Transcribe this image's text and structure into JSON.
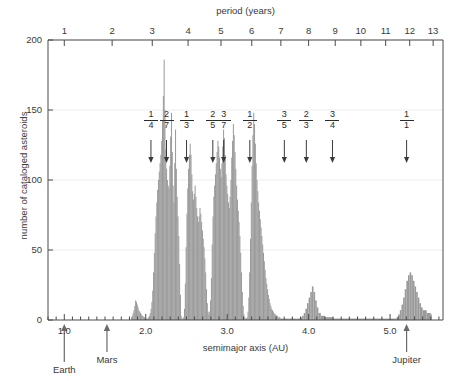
{
  "figure": {
    "top_axis_title": "period (years)",
    "bottom_axis_title": "semimajor axis (AU)",
    "y_axis_title": "number of cataloged asteroids"
  },
  "chart_data": {
    "type": "bar",
    "title": "",
    "xlabel": "semimajor axis (AU)",
    "ylabel": "number of cataloged asteroids",
    "secondary_xlabel": "period (years)",
    "xlim": [
      0.8,
      5.65
    ],
    "ylim": [
      0,
      200
    ],
    "yticks": [
      0,
      50,
      100,
      150,
      200
    ],
    "xticks": [
      1.0,
      2.0,
      3.0,
      4.0,
      5.0
    ],
    "xtick_labels": [
      "1.0",
      "2.0",
      "3.0",
      "4.0",
      "5.0"
    ],
    "xminor_step": 0.1,
    "top_xticks": [
      1,
      2,
      3,
      4,
      5,
      6,
      7,
      8,
      9,
      10,
      11,
      12,
      13,
      14
    ],
    "top_xtick_labels": [
      "1",
      "2",
      "3",
      "4",
      "5",
      "6",
      "7",
      "8",
      "9",
      "10",
      "11",
      "12",
      "13",
      "14"
    ],
    "grid": "horizontal-faint",
    "legend": "none",
    "bar_color": "#9a9a9a",
    "bin_width_au": 0.01,
    "bins_a": [
      1.82,
      1.83,
      1.84,
      1.85,
      1.86,
      1.87,
      1.88,
      1.89,
      1.9,
      1.91,
      1.92,
      1.93,
      1.94,
      1.95,
      1.96,
      1.97,
      1.98,
      1.99,
      2.0,
      2.01,
      2.02,
      2.03,
      2.04,
      2.05,
      2.06,
      2.07,
      2.08,
      2.09,
      2.1,
      2.11,
      2.12,
      2.13,
      2.14,
      2.15,
      2.16,
      2.17,
      2.18,
      2.19,
      2.2,
      2.21,
      2.22,
      2.23,
      2.24,
      2.25,
      2.26,
      2.27,
      2.28,
      2.29,
      2.3,
      2.31,
      2.32,
      2.33,
      2.34,
      2.35,
      2.36,
      2.37,
      2.38,
      2.39,
      2.4,
      2.41,
      2.42,
      2.43,
      2.44,
      2.45,
      2.46,
      2.47,
      2.48,
      2.49,
      2.5,
      2.51,
      2.52,
      2.53,
      2.54,
      2.55,
      2.56,
      2.57,
      2.58,
      2.59,
      2.6,
      2.61,
      2.62,
      2.63,
      2.64,
      2.65,
      2.66,
      2.67,
      2.68,
      2.69,
      2.7,
      2.71,
      2.72,
      2.73,
      2.74,
      2.75,
      2.76,
      2.77,
      2.78,
      2.79,
      2.8,
      2.81,
      2.82,
      2.83,
      2.84,
      2.85,
      2.86,
      2.87,
      2.88,
      2.89,
      2.9,
      2.91,
      2.92,
      2.93,
      2.94,
      2.95,
      2.96,
      2.97,
      2.98,
      2.99,
      3.0,
      3.01,
      3.02,
      3.03,
      3.04,
      3.05,
      3.06,
      3.07,
      3.08,
      3.09,
      3.1,
      3.11,
      3.12,
      3.13,
      3.14,
      3.15,
      3.16,
      3.17,
      3.18,
      3.19,
      3.2,
      3.21,
      3.22,
      3.23,
      3.24,
      3.25,
      3.26,
      3.27,
      3.28,
      3.29,
      3.3,
      3.31,
      3.32,
      3.33,
      3.34,
      3.35,
      3.36,
      3.37,
      3.38,
      3.39,
      3.4,
      3.41,
      3.42,
      3.43,
      3.44,
      3.45,
      3.46,
      3.47,
      3.48,
      3.49,
      3.5,
      3.51,
      3.52,
      3.53,
      3.54,
      3.55,
      3.56,
      3.57,
      3.58,
      3.59,
      3.6,
      3.61,
      3.62,
      3.63,
      3.64,
      3.65,
      3.66,
      3.7,
      3.75,
      3.8,
      3.85,
      3.9,
      3.92,
      3.94,
      3.96,
      3.98,
      4.0,
      4.02,
      4.04,
      4.06,
      4.08,
      4.1,
      4.12,
      4.15,
      4.2,
      4.3,
      4.4,
      4.5,
      4.6,
      4.7,
      4.8,
      4.9,
      5.0,
      5.05,
      5.08,
      5.1,
      5.12,
      5.14,
      5.16,
      5.18,
      5.2,
      5.22,
      5.24,
      5.26,
      5.28,
      5.3,
      5.32,
      5.34,
      5.36,
      5.38,
      5.4,
      5.45,
      5.5
    ],
    "bins_count": [
      2,
      3,
      5,
      7,
      10,
      14,
      13,
      11,
      9,
      7,
      6,
      5,
      4,
      3,
      3,
      2,
      2,
      1,
      1,
      1,
      1,
      2,
      3,
      5,
      8,
      13,
      21,
      34,
      48,
      62,
      74,
      84,
      93,
      100,
      106,
      112,
      118,
      128,
      142,
      160,
      186,
      150,
      122,
      108,
      100,
      96,
      94,
      110,
      131,
      148,
      120,
      96,
      84,
      112,
      136,
      108,
      88,
      74,
      60,
      40,
      18,
      3,
      1,
      1,
      2,
      8,
      26,
      52,
      76,
      94,
      108,
      118,
      126,
      118,
      104,
      92,
      86,
      90,
      96,
      88,
      80,
      74,
      70,
      74,
      80,
      76,
      70,
      64,
      58,
      52,
      44,
      34,
      22,
      12,
      6,
      4,
      6,
      14,
      30,
      54,
      74,
      88,
      96,
      104,
      112,
      120,
      128,
      124,
      116,
      108,
      102,
      112,
      124,
      136,
      130,
      118,
      104,
      96,
      90,
      84,
      80,
      88,
      100,
      116,
      128,
      140,
      132,
      120,
      108,
      96,
      86,
      78,
      70,
      60,
      48,
      34,
      20,
      10,
      4,
      2,
      1,
      1,
      2,
      6,
      16,
      34,
      58,
      84,
      110,
      132,
      148,
      140,
      126,
      112,
      100,
      92,
      84,
      78,
      72,
      66,
      60,
      54,
      48,
      42,
      36,
      30,
      26,
      22,
      18,
      15,
      12,
      10,
      8,
      7,
      6,
      5,
      4,
      4,
      3,
      3,
      2,
      2,
      2,
      1,
      1,
      1,
      1,
      1,
      1,
      2,
      3,
      5,
      8,
      12,
      16,
      20,
      24,
      20,
      14,
      9,
      5,
      3,
      2,
      1,
      1,
      1,
      1,
      1,
      1,
      1,
      1,
      1,
      2,
      4,
      7,
      11,
      16,
      22,
      28,
      32,
      34,
      32,
      28,
      24,
      20,
      16,
      12,
      9,
      7,
      5,
      4,
      2,
      1
    ],
    "resonances": [
      {
        "label_num": "1",
        "label_den": "4",
        "a": 2.064
      },
      {
        "label_num": "2",
        "label_den": "7",
        "a": 2.255
      },
      {
        "label_num": "1",
        "label_den": "3",
        "a": 2.501
      },
      {
        "label_num": "2",
        "label_den": "5",
        "a": 2.824
      },
      {
        "label_num": "3",
        "label_den": "7",
        "a": 2.957
      },
      {
        "label_num": "1",
        "label_den": "2",
        "a": 3.278
      },
      {
        "label_num": "3",
        "label_den": "5",
        "a": 3.702
      },
      {
        "label_num": "2",
        "label_den": "3",
        "a": 3.972
      },
      {
        "label_num": "3",
        "label_den": "4",
        "a": 4.293
      },
      {
        "label_num": "1",
        "label_den": "1",
        "a": 5.203
      }
    ],
    "planets": [
      {
        "name": "Earth",
        "a": 1.0
      },
      {
        "name": "Mars",
        "a": 1.524
      },
      {
        "name": "Jupiter",
        "a": 5.203
      }
    ]
  }
}
